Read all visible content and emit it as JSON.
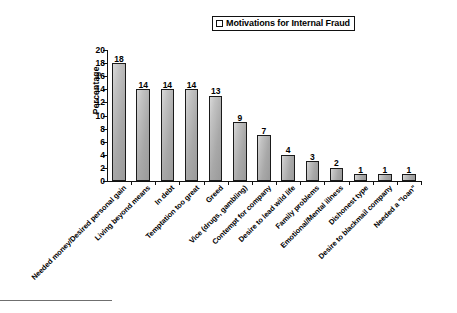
{
  "legend": {
    "marker": "square-outline-marker",
    "label": "Motivations for Internal Fraud"
  },
  "axes": {
    "ylabel": "Percentage",
    "yticks": [
      "0",
      "2",
      "4",
      "6",
      "8",
      "10",
      "12",
      "14",
      "16",
      "18",
      "20"
    ]
  },
  "chart_data": {
    "type": "bar",
    "title": "Motivations for Internal Fraud",
    "xlabel": "",
    "ylabel": "Percentage",
    "ylim": [
      0,
      20
    ],
    "ytick_step": 2,
    "grid": false,
    "legend_position": "top-center-right",
    "legend_entries": [
      "Motivations for Internal Fraud"
    ],
    "categories": [
      "Needed money/Desired personal gain",
      "Living beyond means",
      "In debt",
      "Temptation too great",
      "Greed",
      "Vice (drugs, gambling)",
      "Contempt for company",
      "Desire to lead wild life",
      "Family problems",
      "Emotional/Mental illness",
      "Dishonest type",
      "Desire to blackmail company",
      "Needed a \"loan\""
    ],
    "values": [
      18,
      14,
      14,
      14,
      13,
      9,
      7,
      4,
      3,
      2,
      1,
      1,
      1
    ],
    "data_labels": [
      "18",
      "14",
      "14",
      "14",
      "13",
      "9",
      "7",
      "4",
      "3",
      "2",
      "1",
      "1",
      "1"
    ]
  },
  "colors": {
    "bar_fill_light": "#d9d9d9",
    "bar_fill_dark": "#9a9a9a",
    "bar_outline": "#1a1a1a",
    "axis": "#111111",
    "background": "#ffffff",
    "footnote_rule": "#6f6f6f"
  }
}
